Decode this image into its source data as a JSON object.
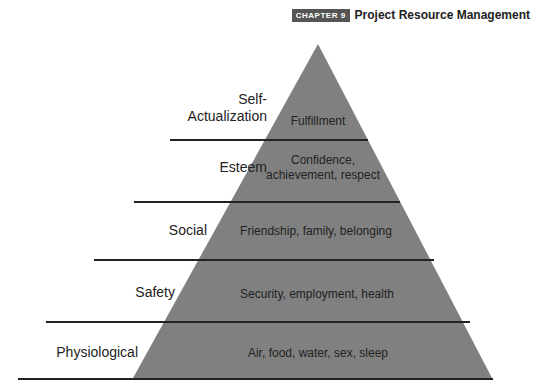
{
  "header": {
    "chapter_badge": "CHAPTER 9",
    "title": "Project Resource Management"
  },
  "pyramid": {
    "fill_color": "#808080",
    "levels": [
      {
        "label": "Self-Actualization",
        "label_line1": "Self-",
        "label_line2": "Actualization",
        "needs": "Fulfillment"
      },
      {
        "label": "Esteem",
        "needs_line1": "Confidence,",
        "needs_line2": "achievement, respect"
      },
      {
        "label": "Social",
        "needs": "Friendship, family, belonging"
      },
      {
        "label": "Safety",
        "needs": "Security, employment, health"
      },
      {
        "label": "Physiological",
        "needs": "Air, food, water, sex, sleep"
      }
    ]
  }
}
